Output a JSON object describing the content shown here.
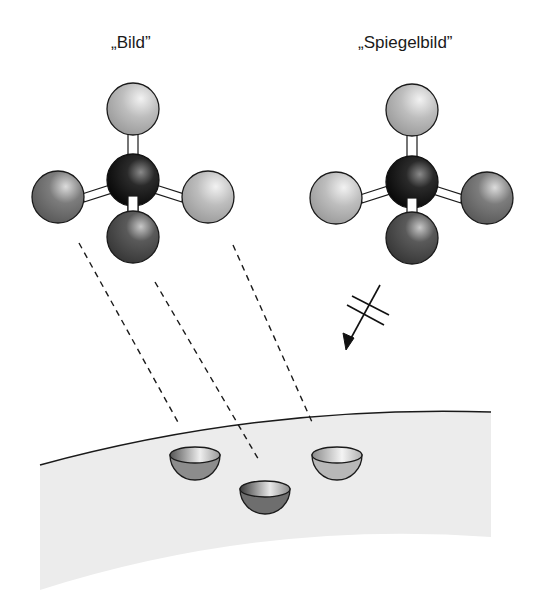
{
  "labels": {
    "image": "„Bild”",
    "mirror_image": "„Spiegelbild”"
  },
  "molecules": [
    {
      "name": "image-molecule",
      "center": {
        "x": 133,
        "y": 180,
        "shade": "black"
      },
      "substituents": [
        {
          "position": "top",
          "x": 133,
          "y": 109,
          "shade": "light-gray"
        },
        {
          "position": "left",
          "x": 58,
          "y": 197,
          "shade": "mid-gray"
        },
        {
          "position": "right",
          "x": 208,
          "y": 197,
          "shade": "light-gray"
        },
        {
          "position": "bottom",
          "x": 133,
          "y": 237,
          "shade": "dark-gray"
        }
      ]
    },
    {
      "name": "mirror-image-molecule",
      "center": {
        "x": 412,
        "y": 182,
        "shade": "black"
      },
      "substituents": [
        {
          "position": "top",
          "x": 412,
          "y": 110,
          "shade": "light-gray"
        },
        {
          "position": "left",
          "x": 336,
          "y": 198,
          "shade": "light-gray"
        },
        {
          "position": "right",
          "x": 487,
          "y": 198,
          "shade": "mid-gray"
        },
        {
          "position": "bottom",
          "x": 412,
          "y": 238,
          "shade": "dark-gray"
        }
      ]
    }
  ],
  "binding_site": {
    "pockets": [
      {
        "name": "pocket-left",
        "shade": "mid-gray"
      },
      {
        "name": "pocket-right",
        "shade": "light-gray"
      },
      {
        "name": "pocket-bottom",
        "shade": "dark-gray"
      }
    ]
  },
  "arrow": {
    "meaning": "does-not-fit",
    "symbol": "crossed-arrow"
  },
  "colors": {
    "black": "#111111",
    "dark_gray": "#555555",
    "mid_gray": "#7a7a7a",
    "light_gray": "#b8b8b8",
    "surface": "#ececec",
    "line": "#1a1a1a"
  }
}
